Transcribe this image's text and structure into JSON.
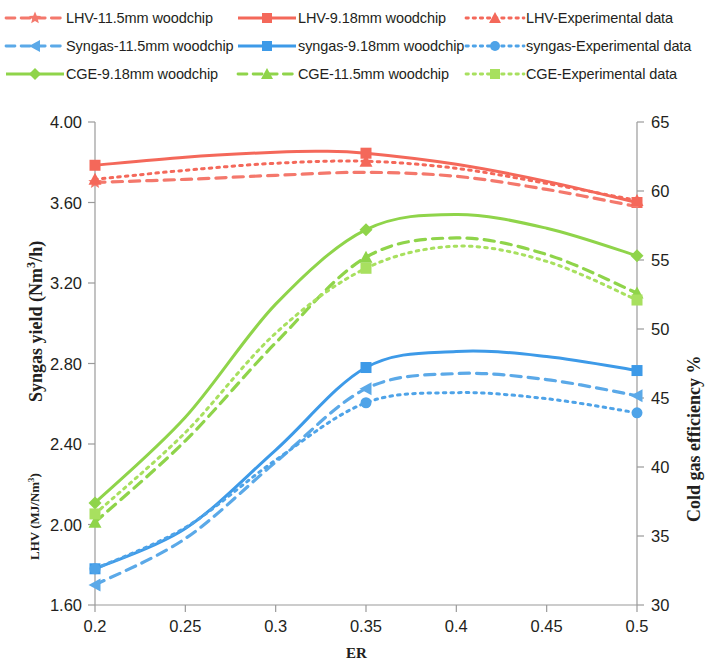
{
  "legend": {
    "rows": [
      [
        {
          "label": "LHV-11.5mm woodchip",
          "color": "#f4786c",
          "style": "dashed",
          "marker": "star",
          "key": "lhv_11_5"
        },
        {
          "label": "LHV-9.18mm woodchip",
          "color": "#f4685a",
          "style": "solid",
          "marker": "square",
          "key": "lhv_9_18"
        },
        {
          "label": "LHV-Experimental data",
          "color": "#f4685a",
          "style": "dotted",
          "marker": "triangle",
          "key": "lhv_exp"
        }
      ],
      [
        {
          "label": "Syngas-11.5mm woodchip",
          "color": "#5ba9e8",
          "style": "dashed",
          "marker": "triangle-left",
          "key": "syngas_11_5"
        },
        {
          "label": "syngas-9.18mm woodchip",
          "color": "#3d9ae8",
          "style": "solid",
          "marker": "square",
          "key": "syngas_9_18"
        },
        {
          "label": "syngas-Experimental data",
          "color": "#4ea3e8",
          "style": "dotted",
          "marker": "circle",
          "key": "syngas_exp"
        }
      ],
      [
        {
          "label": "CGE-9.18mm woodchip",
          "color": "#8fd44a",
          "style": "solid",
          "marker": "diamond",
          "key": "cge_9_18"
        },
        {
          "label": "CGE-11.5mm woodchip",
          "color": "#8fd44a",
          "style": "dashed",
          "marker": "triangle",
          "key": "cge_11_5"
        },
        {
          "label": "CGE-Experimental data",
          "color": "#a8e05f",
          "style": "dotted",
          "marker": "square",
          "key": "cge_exp"
        }
      ]
    ]
  },
  "chart_data": {
    "type": "line",
    "title": "",
    "xlabel": "ER",
    "ylabel_left_primary": "Syngas yield (Nm3/h)",
    "ylabel_left_secondary": "LHV (MJ/Nm3)",
    "ylabel_right": "Cold gas efficiency %",
    "grid": false,
    "x": [
      0.2,
      0.25,
      0.3,
      0.35,
      0.4,
      0.45,
      0.5
    ],
    "xlim": [
      0.2,
      0.5
    ],
    "xticks": [
      "0.2",
      "0.25",
      "0.3",
      "0.35",
      "0.4",
      "0.45",
      "0.5"
    ],
    "ylim_left": [
      1.6,
      4.0
    ],
    "yticks_left": [
      "1.60",
      "2.00",
      "2.40",
      "2.80",
      "3.20",
      "3.60",
      "4.00"
    ],
    "ylim_right": [
      30,
      65
    ],
    "yticks_right": [
      "30",
      "35",
      "40",
      "45",
      "50",
      "55",
      "60",
      "65"
    ],
    "series": [
      {
        "name": "LHV-9.18mm woodchip",
        "key": "lhv_9_18",
        "axis": "left",
        "unit": "MJ/Nm3",
        "color": "#f4685a",
        "style": "solid",
        "marker": "square",
        "marker_x": [
          0.2,
          0.35,
          0.5
        ],
        "x": [
          0.2,
          0.25,
          0.3,
          0.325,
          0.35,
          0.4,
          0.45,
          0.5
        ],
        "values": [
          3.785,
          3.825,
          3.85,
          3.855,
          3.845,
          3.79,
          3.705,
          3.6
        ]
      },
      {
        "name": "LHV-11.5mm woodchip",
        "key": "lhv_11_5",
        "axis": "left",
        "unit": "MJ/Nm3",
        "color": "#f4786c",
        "style": "dashed",
        "marker": "star",
        "marker_x": [
          0.2
        ],
        "x": [
          0.2,
          0.25,
          0.3,
          0.35,
          0.4,
          0.45,
          0.5
        ],
        "values": [
          3.7,
          3.715,
          3.735,
          3.75,
          3.73,
          3.665,
          3.58
        ]
      },
      {
        "name": "LHV-Experimental data",
        "key": "lhv_exp",
        "axis": "left",
        "unit": "MJ/Nm3",
        "color": "#f4685a",
        "style": "dotted",
        "marker": "triangle",
        "marker_x": [
          0.2,
          0.35,
          0.5
        ],
        "x": [
          0.2,
          0.25,
          0.3,
          0.35,
          0.4,
          0.45,
          0.5
        ],
        "values": [
          3.715,
          3.76,
          3.795,
          3.805,
          3.77,
          3.695,
          3.61
        ]
      },
      {
        "name": "CGE-9.18mm woodchip",
        "key": "cge_9_18",
        "axis": "right",
        "unit": "%",
        "color": "#8fd44a",
        "style": "solid",
        "marker": "diamond",
        "marker_x": [
          0.2,
          0.35,
          0.5
        ],
        "x": [
          0.2,
          0.25,
          0.3,
          0.35,
          0.4,
          0.45,
          0.5
        ],
        "values": [
          37.4,
          43.6,
          51.8,
          57.2,
          58.3,
          57.3,
          55.3
        ]
      },
      {
        "name": "CGE-11.5mm woodchip",
        "key": "cge_11_5",
        "axis": "right",
        "unit": "%",
        "color": "#8fd44a",
        "style": "dashed",
        "marker": "triangle",
        "marker_x": [
          0.2,
          0.35,
          0.5
        ],
        "x": [
          0.2,
          0.25,
          0.3,
          0.35,
          0.4,
          0.45,
          0.5
        ],
        "values": [
          36.0,
          41.9,
          49.0,
          55.2,
          56.6,
          55.4,
          52.6
        ]
      },
      {
        "name": "CGE-Experimental data",
        "key": "cge_exp",
        "axis": "right",
        "unit": "%",
        "color": "#a8e05f",
        "style": "dotted",
        "marker": "square",
        "marker_x": [
          0.2,
          0.35,
          0.5
        ],
        "x": [
          0.2,
          0.25,
          0.3,
          0.35,
          0.4,
          0.45,
          0.5
        ],
        "values": [
          36.6,
          42.5,
          49.7,
          54.4,
          56.0,
          54.9,
          52.1
        ]
      },
      {
        "name": "syngas-9.18mm woodchip",
        "key": "syngas_9_18",
        "axis": "left",
        "unit": "Nm3/h",
        "color": "#3d9ae8",
        "style": "solid",
        "marker": "square",
        "marker_x": [
          0.2,
          0.35,
          0.5
        ],
        "x": [
          0.2,
          0.25,
          0.3,
          0.35,
          0.4,
          0.45,
          0.5
        ],
        "values": [
          1.78,
          1.98,
          2.37,
          2.78,
          2.86,
          2.835,
          2.765
        ]
      },
      {
        "name": "Syngas-11.5mm woodchip",
        "key": "syngas_11_5",
        "axis": "left",
        "unit": "Nm3/h",
        "color": "#5ba9e8",
        "style": "dashed",
        "marker": "triangle-left",
        "marker_x": [
          0.2,
          0.35,
          0.5
        ],
        "x": [
          0.2,
          0.25,
          0.3,
          0.35,
          0.4,
          0.45,
          0.5
        ],
        "values": [
          1.7,
          1.93,
          2.31,
          2.675,
          2.75,
          2.72,
          2.64
        ]
      },
      {
        "name": "syngas-Experimental data",
        "key": "syngas_exp",
        "axis": "left",
        "unit": "Nm3/h",
        "color": "#4ea3e8",
        "style": "dotted",
        "marker": "circle",
        "marker_x": [
          0.2,
          0.35,
          0.5
        ],
        "x": [
          0.2,
          0.25,
          0.3,
          0.35,
          0.4,
          0.45,
          0.5
        ],
        "values": [
          1.78,
          1.985,
          2.32,
          2.605,
          2.655,
          2.625,
          2.555
        ]
      }
    ]
  }
}
